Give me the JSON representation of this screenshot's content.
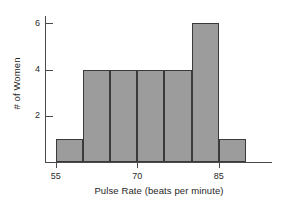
{
  "chart_data": {
    "type": "bar",
    "title": "",
    "subtitle": "",
    "xlabel": "Pulse Rate (beats per minute)",
    "ylabel": "# of Women",
    "categories": [
      "55-60",
      "60-65",
      "65-70",
      "70-75",
      "75-80",
      "80-85",
      "85-90"
    ],
    "bin_edges": [
      55,
      60,
      65,
      70,
      75,
      80,
      85,
      90
    ],
    "bin_width": 5,
    "values": [
      1,
      4,
      4,
      4,
      4,
      6,
      1
    ],
    "xlim": [
      53,
      95
    ],
    "ylim": [
      0,
      6.4
    ],
    "xticks": [
      55,
      70,
      85
    ],
    "xtick_labels": [
      "55",
      "70",
      "85"
    ],
    "yticks": [
      2,
      4,
      6
    ],
    "ytick_labels": [
      "2",
      "4",
      "6"
    ],
    "grid": false,
    "legend": false,
    "legend_position": "none",
    "bar_fill_color": "#9c9c9c",
    "bar_edge_color": "#3a3a3a",
    "axis_color": "#4a4a4a",
    "background_color": "#ffffff",
    "annotations": []
  },
  "axes": {
    "x_title": "Pulse Rate (beats per minute)",
    "y_title": "# of Women"
  }
}
